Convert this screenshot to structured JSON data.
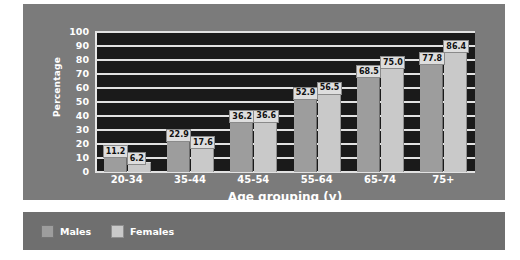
{
  "chart_data": {
    "type": "bar",
    "title": "",
    "xlabel": "Age grouping (y)",
    "ylabel": "Percentage",
    "categories": [
      "20-34",
      "35-44",
      "45-54",
      "55-64",
      "65-74",
      "75+"
    ],
    "series": [
      {
        "name": "Males",
        "color": "#9d9d9d",
        "values": [
          11.2,
          22.9,
          36.2,
          52.9,
          68.5,
          77.8
        ],
        "labels": [
          "11.2",
          "22.9",
          "36.2",
          "52.9",
          "68.5",
          "77.8"
        ]
      },
      {
        "name": "Females",
        "color": "#c9c9c9",
        "values": [
          6.2,
          17.6,
          36.6,
          56.5,
          75.0,
          86.4
        ],
        "labels": [
          "6.2",
          "17.6",
          "36.6",
          "56.5",
          "75.0",
          "86.4"
        ]
      }
    ],
    "ylim": [
      0,
      100
    ],
    "yticks": [
      100,
      90,
      80,
      70,
      60,
      50,
      40,
      30,
      20,
      10,
      0
    ],
    "ytick_labels": [
      "100",
      "90",
      "80",
      "70",
      "60",
      "50",
      "40",
      "30",
      "20",
      "10",
      "0"
    ],
    "grid": true,
    "legend_position": "bottom-left",
    "plot_background": "#1a1a1a",
    "panel_background": "#7b7b7b",
    "gridline_color": "#e2e2e2",
    "text_color": "#ffffff"
  },
  "legend": {
    "items": [
      {
        "label": "Males",
        "swatch": "male"
      },
      {
        "label": "Females",
        "swatch": "female"
      }
    ]
  }
}
